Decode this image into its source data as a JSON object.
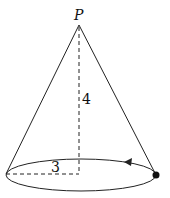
{
  "diagram": {
    "type": "cone",
    "apex_label": "P",
    "height_label": "4",
    "radius_label": "3",
    "colors": {
      "stroke": "#222222",
      "background": "#ffffff"
    },
    "marker": "point-on-rim",
    "arrow_direction": "counterclockwise-along-rim"
  }
}
